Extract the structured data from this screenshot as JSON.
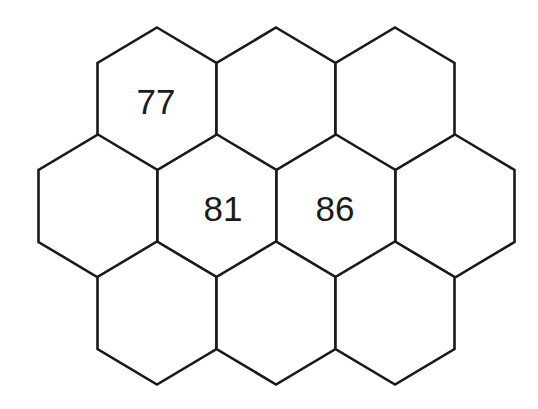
{
  "diagram": {
    "type": "hexagon-grid",
    "orientation": "pointy-top",
    "stroke_color": "#1a1a1a",
    "background": "#ffffff",
    "geometry": {
      "half_width": 59.5,
      "rise": 35.5,
      "half_edge": 36
    },
    "rows": [
      {
        "row": 0,
        "cy": 99,
        "cells": [
          {
            "id": "r0c0",
            "cx": 157,
            "label": "77",
            "label_cx": 156,
            "label_cy": 101
          },
          {
            "id": "r0c1",
            "cx": 276,
            "label": ""
          },
          {
            "id": "r0c2",
            "cx": 395,
            "label": ""
          }
        ]
      },
      {
        "row": 1,
        "cy": 206,
        "cells": [
          {
            "id": "r1c0",
            "cx": 98,
            "label": ""
          },
          {
            "id": "r1c1",
            "cx": 217,
            "label": "81",
            "label_cx": 223,
            "label_cy": 208
          },
          {
            "id": "r1c2",
            "cx": 336,
            "label": "86",
            "label_cx": 335,
            "label_cy": 208
          },
          {
            "id": "r1c3",
            "cx": 455,
            "label": ""
          }
        ]
      },
      {
        "row": 2,
        "cy": 313,
        "cells": [
          {
            "id": "r2c0",
            "cx": 157,
            "label": ""
          },
          {
            "id": "r2c1",
            "cx": 276,
            "label": ""
          },
          {
            "id": "r2c2",
            "cx": 395,
            "label": ""
          }
        ]
      }
    ]
  }
}
